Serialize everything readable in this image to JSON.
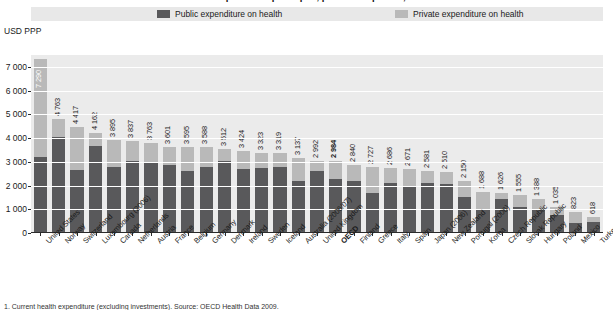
{
  "chart": {
    "title": "Health expenditure per capita, public and private, 2007",
    "unit_label": "USD PPP",
    "footnote": "1. Current health expenditure (excluding investments). Source: OECD Health Data 2009."
  },
  "legend": {
    "items": [
      {
        "label": "Public expenditure on health",
        "color": "#59595b",
        "name": "public"
      },
      {
        "label": "Private expenditure on health",
        "color": "#b9b9b9",
        "name": "private"
      }
    ]
  },
  "chart_data": {
    "type": "bar",
    "subtype": "stacked-vertical",
    "title": "Health expenditure per capita, public and private, 2007",
    "xlabel": "",
    "ylabel": "USD PPP",
    "ylim": [
      0,
      7500
    ],
    "yticks": [
      0,
      1000,
      2000,
      3000,
      4000,
      5000,
      6000,
      7000
    ],
    "ytick_labels": [
      "0",
      "1 000",
      "2 000",
      "3 000",
      "4 000",
      "5 000",
      "6 000",
      "7 000"
    ],
    "grid": true,
    "legend_position": "top",
    "categories": [
      "United States",
      "Norway",
      "Switzerland",
      "Luxembourg (2006)",
      "Canada",
      "Netherlands",
      "Austria",
      "France",
      "Belgium",
      "Germany",
      "Denmark",
      "Ireland",
      "Sweden",
      "Iceland",
      "Australia (2006/07)",
      "United Kingdom",
      "OECD",
      "Finland",
      "Greece",
      "Italy",
      "Spain",
      "Japan (2006)",
      "New Zealand",
      "Portugal (2006)",
      "Korea",
      "Czech Republic",
      "Slovak Republic",
      "Hungary",
      "Poland",
      "Mexico",
      "Turkey (2005)"
    ],
    "totals": [
      7290,
      4763,
      4417,
      4162,
      3895,
      3837,
      3763,
      3601,
      3595,
      3588,
      3512,
      3424,
      3323,
      3319,
      3137,
      2992,
      2984,
      2840,
      2727,
      2686,
      2671,
      2581,
      2510,
      2150,
      1688,
      1626,
      1555,
      1388,
      1035,
      823,
      618
    ],
    "series": [
      {
        "name": "Public expenditure on health",
        "color": "#59595b",
        "values": [
          3160,
          3990,
          2610,
          3630,
          2730,
          3000,
          2890,
          2840,
          2570,
          2760,
          2990,
          2660,
          2710,
          2720,
          2130,
          2570,
          2230,
          2150,
          1650,
          2080,
          1890,
          2080,
          2010,
          1470,
          910,
          1400,
          1040,
          990,
          730,
          370,
          420
        ]
      },
      {
        "name": "Private expenditure on health",
        "color": "#b9b9b9",
        "values": [
          4130,
          773,
          1807,
          532,
          1165,
          837,
          873,
          761,
          1025,
          828,
          522,
          764,
          613,
          599,
          1007,
          422,
          754,
          690,
          1077,
          606,
          781,
          501,
          500,
          680,
          778,
          226,
          515,
          398,
          305,
          453,
          198
        ]
      }
    ],
    "highlight_category": "OECD"
  }
}
